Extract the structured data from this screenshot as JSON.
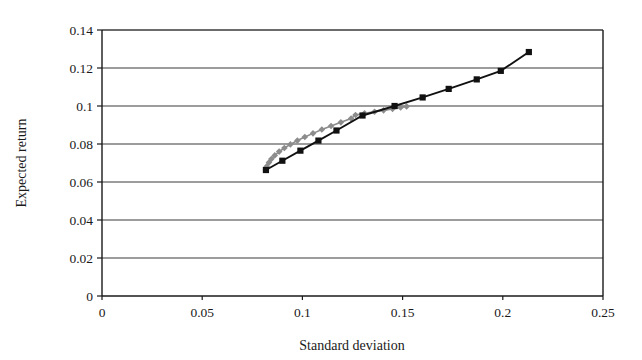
{
  "chart_data": {
    "type": "scatter",
    "title": "",
    "subtitle": "",
    "xlabel": "Standard deviation",
    "ylabel": "Expected return",
    "xlim": [
      0,
      0.25
    ],
    "ylim": [
      0,
      0.14
    ],
    "xticks": [
      0,
      0.05,
      0.1,
      0.15,
      0.2,
      0.25
    ],
    "xtick_labels": [
      "0",
      "0.05",
      "0.1",
      "0.15",
      "0.2",
      "0.25"
    ],
    "yticks": [
      0,
      0.02,
      0.04,
      0.06,
      0.08,
      0.1,
      0.12,
      0.14
    ],
    "ytick_labels": [
      "0",
      "0.02",
      "0.04",
      "0.06",
      "0.08",
      "0.1",
      "0.12",
      "0.14"
    ],
    "grid": "horizontal",
    "legend": "none",
    "series": [
      {
        "name": "gray-frontier",
        "color": "#8c8c8c",
        "marker": "diamond",
        "line": true,
        "points": [
          [
            0.0818,
            0.0663
          ],
          [
            0.0822,
            0.0682
          ],
          [
            0.0833,
            0.0702
          ],
          [
            0.0845,
            0.0721
          ],
          [
            0.0862,
            0.074
          ],
          [
            0.0884,
            0.076
          ],
          [
            0.091,
            0.0779
          ],
          [
            0.094,
            0.0798
          ],
          [
            0.0975,
            0.0818
          ],
          [
            0.1012,
            0.0837
          ],
          [
            0.1053,
            0.0856
          ],
          [
            0.1097,
            0.0876
          ],
          [
            0.1143,
            0.0895
          ],
          [
            0.1192,
            0.0914
          ],
          [
            0.1243,
            0.0934
          ],
          [
            0.1265,
            0.0953
          ],
          [
            0.131,
            0.0962
          ],
          [
            0.136,
            0.097
          ],
          [
            0.1405,
            0.0977
          ],
          [
            0.145,
            0.0985
          ],
          [
            0.149,
            0.0992
          ],
          [
            0.152,
            0.0998
          ]
        ]
      },
      {
        "name": "black-capital-market-line",
        "color": "#111111",
        "marker": "square",
        "line": true,
        "points": [
          [
            0.0818,
            0.0663
          ],
          [
            0.09,
            0.0712
          ],
          [
            0.099,
            0.0765
          ],
          [
            0.108,
            0.0818
          ],
          [
            0.117,
            0.0871
          ],
          [
            0.13,
            0.095
          ],
          [
            0.146,
            0.1
          ],
          [
            0.16,
            0.1045
          ],
          [
            0.173,
            0.109
          ],
          [
            0.187,
            0.114
          ],
          [
            0.199,
            0.1185
          ],
          [
            0.213,
            0.1284
          ]
        ]
      }
    ]
  },
  "figure": {
    "axis_color": "#1a1a1a",
    "grid_color": "#3a3a3a",
    "background": "#ffffff"
  }
}
